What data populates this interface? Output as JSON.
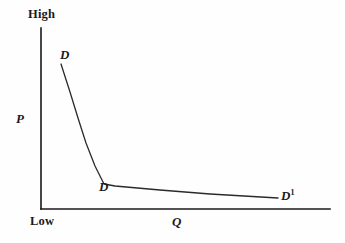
{
  "figure": {
    "title_text": "",
    "background_color": "#fefefe",
    "ink_color": "#1a1a1a"
  },
  "axes": {
    "y_axis": {
      "variable_label": "P",
      "top_label": "High",
      "bottom_label": "Low"
    },
    "x_axis": {
      "variable_label": "Q"
    }
  },
  "curve_labels": {
    "upper": "D",
    "kink": "D",
    "right_base": "D",
    "right_superscript": "1"
  },
  "chart_data": {
    "type": "line",
    "title": "",
    "xlabel": "Q",
    "ylabel": "P",
    "grid": false,
    "legend": "none",
    "axis_qualitative_ticks": {
      "y_top": "High",
      "y_bottom": "Low"
    },
    "xlim": [
      0,
      100
    ],
    "ylim": [
      0,
      100
    ],
    "series": [
      {
        "name": "D",
        "annotation_labels": [
          "D",
          "D",
          "D1"
        ],
        "description": "kinked demand curve: steep upper segment falling sharply, then a sharp kink into a nearly flat lower segment",
        "points_px": [
          [
            61,
            64
          ],
          [
            70,
            92
          ],
          [
            78,
            118
          ],
          [
            86,
            143
          ],
          [
            95,
            166
          ],
          [
            104,
            184
          ],
          [
            115,
            186
          ],
          [
            160,
            190
          ],
          [
            210,
            194
          ],
          [
            278,
            198
          ]
        ]
      }
    ],
    "axis_px": {
      "origin": [
        41,
        209
      ],
      "y_axis_top": [
        41,
        28
      ],
      "x_axis_right": [
        330,
        209
      ]
    }
  }
}
